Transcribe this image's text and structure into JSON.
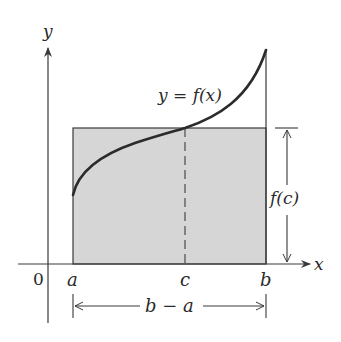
{
  "diagram": {
    "axes": {
      "x_label": "x",
      "y_label": "y",
      "origin_label": "0"
    },
    "curve": {
      "label": "y = f(x)"
    },
    "points": {
      "a_label": "a",
      "b_label": "b",
      "c_label": "c"
    },
    "dimensions": {
      "height_label": "f(c)",
      "width_label": "b − a"
    },
    "colors": {
      "stroke": "#3a3a3a",
      "curve": "#2b2b2b",
      "fill": "#d6d6d6",
      "text": "#2a2a2a"
    }
  }
}
